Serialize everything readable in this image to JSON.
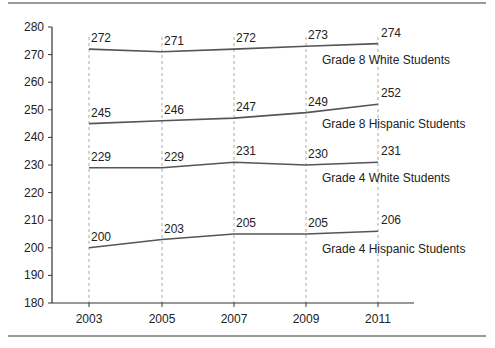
{
  "chart_data": {
    "type": "line",
    "title": "",
    "xlabel": "",
    "ylabel": "",
    "x": [
      "2003",
      "2005",
      "2007",
      "2009",
      "2011"
    ],
    "ylim": [
      180,
      280
    ],
    "yticks": [
      180,
      190,
      200,
      210,
      220,
      230,
      240,
      250,
      260,
      270,
      280
    ],
    "grid": "vertical dashed lines at each x",
    "legend": "inline labels below each line",
    "series": [
      {
        "name": "Grade 8 White Students",
        "values": [
          272,
          271,
          272,
          273,
          274
        ]
      },
      {
        "name": "Grade 8 Hispanic Students",
        "values": [
          245,
          246,
          247,
          249,
          252
        ]
      },
      {
        "name": "Grade 4 White Students",
        "values": [
          229,
          229,
          231,
          230,
          231
        ]
      },
      {
        "name": "Grade 4 Hispanic Students",
        "values": [
          200,
          203,
          205,
          205,
          206
        ]
      }
    ],
    "colors": {
      "line": "#555555",
      "axis": "#333333",
      "grid": "#aaaaaa",
      "rule": "#777777"
    }
  }
}
